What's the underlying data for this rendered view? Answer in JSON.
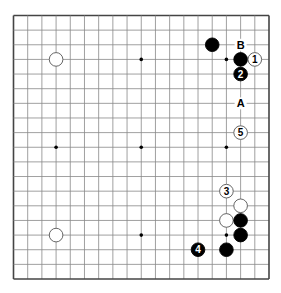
{
  "board": {
    "size": 19,
    "line_color": "#888888",
    "border_color": "#444444",
    "star_points": [
      [
        3,
        3
      ],
      [
        9,
        3
      ],
      [
        15,
        3
      ],
      [
        3,
        9
      ],
      [
        9,
        9
      ],
      [
        15,
        9
      ],
      [
        3,
        15
      ],
      [
        9,
        15
      ],
      [
        15,
        15
      ]
    ],
    "stones": [
      {
        "color": "white",
        "col": 3,
        "row": 3,
        "label": ""
      },
      {
        "color": "black",
        "col": 14,
        "row": 2,
        "label": ""
      },
      {
        "color": "black",
        "col": 16,
        "row": 3,
        "label": ""
      },
      {
        "color": "white",
        "col": 17,
        "row": 3,
        "label": "1"
      },
      {
        "color": "black",
        "col": 16,
        "row": 4,
        "label": "2"
      },
      {
        "color": "white",
        "col": 15,
        "row": 12,
        "label": "3"
      },
      {
        "color": "black",
        "col": 13,
        "row": 16,
        "label": "4"
      },
      {
        "color": "white",
        "col": 16,
        "row": 8,
        "label": "5"
      },
      {
        "color": "white",
        "col": 16,
        "row": 13,
        "label": ""
      },
      {
        "color": "white",
        "col": 15,
        "row": 14,
        "label": ""
      },
      {
        "color": "black",
        "col": 16,
        "row": 14,
        "label": ""
      },
      {
        "color": "black",
        "col": 16,
        "row": 15,
        "label": ""
      },
      {
        "color": "black",
        "col": 15,
        "row": 16,
        "label": ""
      },
      {
        "color": "white",
        "col": 3,
        "row": 15,
        "label": ""
      }
    ],
    "markers": [
      {
        "label": "B",
        "col": 16,
        "row": 2
      },
      {
        "label": "A",
        "col": 16,
        "row": 6
      }
    ]
  }
}
